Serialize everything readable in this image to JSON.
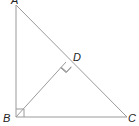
{
  "diagram": {
    "type": "geometry",
    "colors": {
      "line": "#9a9a9a",
      "label": "#222222",
      "background": "#ffffff"
    },
    "points": {
      "A": {
        "label": "A",
        "x": 16,
        "y": 5
      },
      "B": {
        "label": "B",
        "x": 16,
        "y": 117
      },
      "C": {
        "label": "C",
        "x": 127,
        "y": 117
      },
      "D": {
        "label": "D",
        "x": 66,
        "y": 62
      }
    },
    "segments": [
      "AB",
      "BC",
      "AC",
      "BD"
    ],
    "right_angles": [
      {
        "at": "B",
        "between": [
          "BA",
          "BC"
        ]
      },
      {
        "at": "D",
        "between": [
          "DB",
          "DA"
        ]
      }
    ]
  }
}
